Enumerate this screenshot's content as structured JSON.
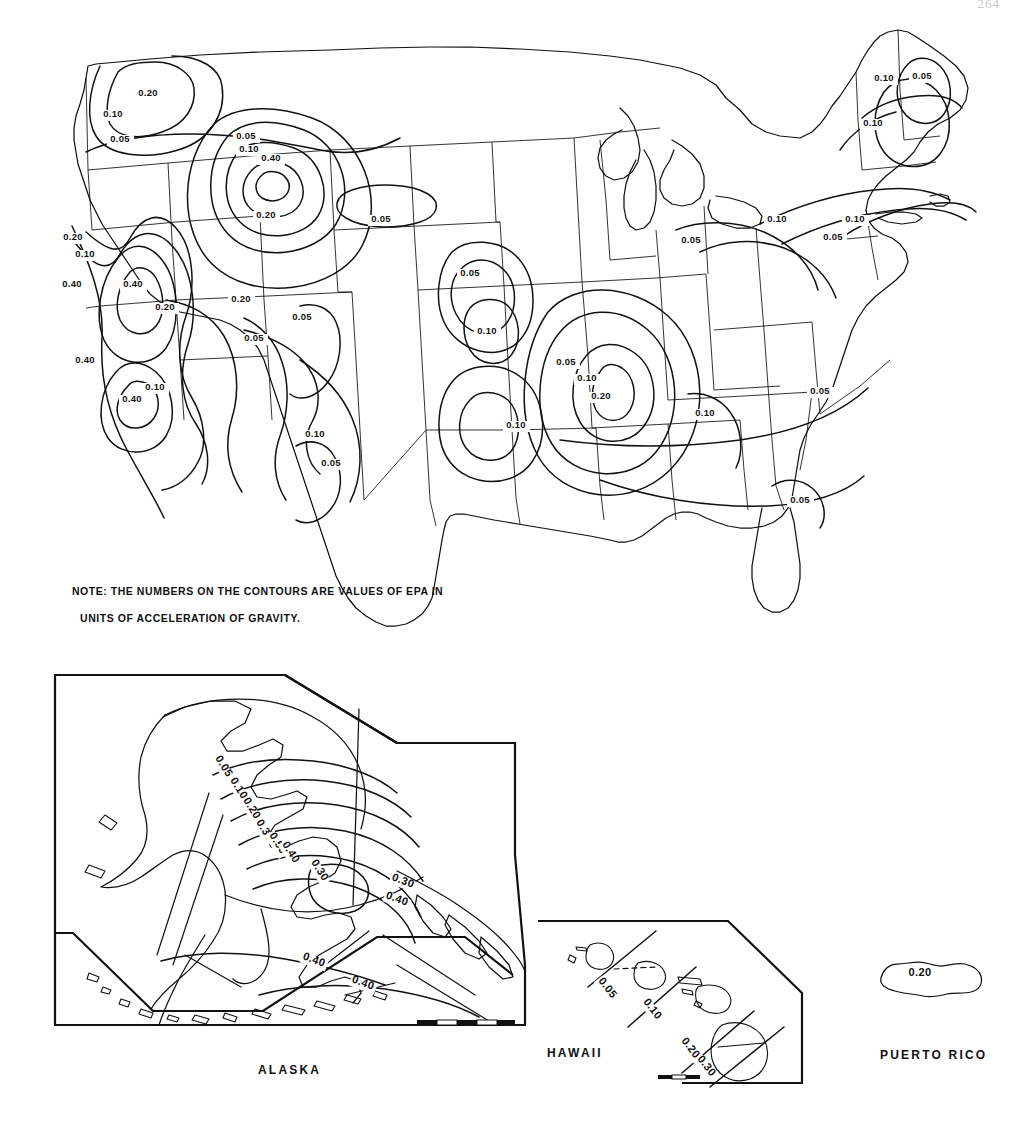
{
  "document": {
    "page_number": "264",
    "note_line1": "NOTE: THE NUMBERS ON THE CONTOURS ARE VALUES OF EPA IN",
    "note_line2": "UNITS OF ACCELERATION OF GRAVITY."
  },
  "regions": {
    "alaska_label": "ALASKA",
    "hawaii_label": "HAWAII",
    "puerto_rico_label": "PUERTO  RICO"
  },
  "chart_data": {
    "type": "map",
    "units": "acceleration of gravity (g)",
    "contour_levels": [
      0.05,
      0.1,
      0.2,
      0.3,
      0.4,
      0.5
    ],
    "panels": [
      {
        "name": "conterminous-united-states",
        "label": "",
        "contour_labels": [
          {
            "value": "0.20",
            "x": 148,
            "y": 96
          },
          {
            "value": "0.10",
            "x": 113,
            "y": 117
          },
          {
            "value": "0.05",
            "x": 120,
            "y": 142
          },
          {
            "value": "0.10",
            "x": 249,
            "y": 152
          },
          {
            "value": "0.40",
            "x": 271,
            "y": 161
          },
          {
            "value": "0.05",
            "x": 246,
            "y": 139
          },
          {
            "value": "0.20",
            "x": 266,
            "y": 218
          },
          {
            "value": "0.05",
            "x": 381,
            "y": 222
          },
          {
            "value": "0.05",
            "x": 470,
            "y": 276
          },
          {
            "value": "0.10",
            "x": 487,
            "y": 334
          },
          {
            "value": "0.20",
            "x": 73,
            "y": 240
          },
          {
            "value": "0.10",
            "x": 85,
            "y": 257
          },
          {
            "value": "0.40",
            "x": 72,
            "y": 287
          },
          {
            "value": "0.40",
            "x": 133,
            "y": 287
          },
          {
            "value": "0.20",
            "x": 165,
            "y": 310
          },
          {
            "value": "0.20",
            "x": 241,
            "y": 302
          },
          {
            "value": "0.05",
            "x": 254,
            "y": 341
          },
          {
            "value": "0.05",
            "x": 302,
            "y": 320
          },
          {
            "value": "0.40",
            "x": 85,
            "y": 363
          },
          {
            "value": "0.10",
            "x": 155,
            "y": 390
          },
          {
            "value": "0.40",
            "x": 132,
            "y": 402
          },
          {
            "value": "0.10",
            "x": 315,
            "y": 437
          },
          {
            "value": "0.05",
            "x": 331,
            "y": 466
          },
          {
            "value": "0.10",
            "x": 516,
            "y": 428
          },
          {
            "value": "0.05",
            "x": 566,
            "y": 365
          },
          {
            "value": "0.10",
            "x": 587,
            "y": 381
          },
          {
            "value": "0.20",
            "x": 601,
            "y": 399
          },
          {
            "value": "0.10",
            "x": 705,
            "y": 416
          },
          {
            "value": "0.05",
            "x": 691,
            "y": 243
          },
          {
            "value": "0.10",
            "x": 777,
            "y": 222
          },
          {
            "value": "0.10",
            "x": 855,
            "y": 222
          },
          {
            "value": "0.05",
            "x": 833,
            "y": 240
          },
          {
            "value": "0.10",
            "x": 884,
            "y": 81
          },
          {
            "value": "0.05",
            "x": 922,
            "y": 79
          },
          {
            "value": "0.10",
            "x": 873,
            "y": 126
          },
          {
            "value": "0.05",
            "x": 820,
            "y": 394
          },
          {
            "value": "0.05",
            "x": 800,
            "y": 503
          }
        ]
      },
      {
        "name": "alaska",
        "label": "ALASKA",
        "contour_labels": [
          {
            "value": "0.05",
            "x": 221,
            "y": 768
          },
          {
            "value": "0.10",
            "x": 236,
            "y": 790
          },
          {
            "value": "0.20",
            "x": 249,
            "y": 810
          },
          {
            "value": "0.30",
            "x": 262,
            "y": 832
          },
          {
            "value": "0.50",
            "x": 275,
            "y": 845
          },
          {
            "value": "0.40",
            "x": 288,
            "y": 854
          },
          {
            "value": "0.30",
            "x": 317,
            "y": 872
          },
          {
            "value": "0.30",
            "x": 402,
            "y": 884
          },
          {
            "value": "0.40",
            "x": 396,
            "y": 902
          },
          {
            "value": "0.40",
            "x": 313,
            "y": 963
          },
          {
            "value": "0.40",
            "x": 362,
            "y": 986
          }
        ],
        "scale_bar": true
      },
      {
        "name": "hawaii",
        "label": "HAWAII",
        "contour_labels": [
          {
            "value": "0.05",
            "x": 605,
            "y": 990
          },
          {
            "value": "0.10",
            "x": 650,
            "y": 1011
          },
          {
            "value": "0.20",
            "x": 688,
            "y": 1050
          },
          {
            "value": "0.30",
            "x": 704,
            "y": 1068
          }
        ],
        "scale_bar": true
      },
      {
        "name": "puerto-rico",
        "label": "PUERTO  RICO",
        "contour_labels": [
          {
            "value": "0.20",
            "x": 920,
            "y": 976
          }
        ],
        "scale_bar": false
      }
    ]
  }
}
